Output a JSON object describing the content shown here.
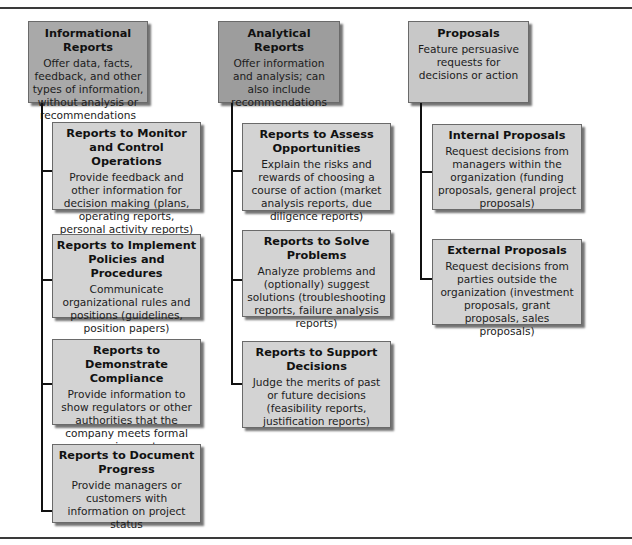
{
  "caption": "Figure: Common types of business reports and proposals",
  "colors": {
    "informational_parent": "#a9a9a9",
    "analytical_parent": "#9d9d9d",
    "proposals_parent": "#c8c8c8",
    "child_box": "#d3d3d3",
    "connector": "#111111",
    "rule": "#3a3a3a"
  },
  "columns": [
    {
      "title": "Informational Reports",
      "desc": "Offer data, facts, feedback, and other types of information, without analysis or recommendations",
      "children": [
        {
          "title": "Reports to Monitor and Control Operations",
          "desc": "Provide feedback and other information for decision making (plans, operating reports, personal activity reports)"
        },
        {
          "title": "Reports to Implement Policies and Procedures",
          "desc": "Communicate organizational rules and positions (guidelines, position papers)"
        },
        {
          "title": "Reports to Demonstrate Compliance",
          "desc": "Provide information to show regulators or other authorities that the company meets formal requirements"
        },
        {
          "title": "Reports to Document Progress",
          "desc": "Provide managers or customers with information on project status"
        }
      ]
    },
    {
      "title": "Analytical Reports",
      "desc": "Offer information and analysis; can also include recommendations",
      "children": [
        {
          "title": "Reports to Assess Opportunities",
          "desc": "Explain the risks and rewards of choosing a course of action (market analysis reports, due diligence reports)"
        },
        {
          "title": "Reports to Solve Problems",
          "desc": "Analyze problems and (optionally) suggest solutions (troubleshooting reports, failure analysis reports)"
        },
        {
          "title": "Reports to Support Decisions",
          "desc": "Judge the merits of past or future decisions (feasibility reports, justification reports)"
        }
      ]
    },
    {
      "title": "Proposals",
      "desc": "Feature persuasive requests for decisions or action",
      "children": [
        {
          "title": "Internal Proposals",
          "desc": "Request decisions from managers within the organization (funding proposals, general project proposals)"
        },
        {
          "title": "External Proposals",
          "desc": "Request decisions from parties outside the organization (investment proposals, grant proposals, sales proposals)"
        }
      ]
    }
  ]
}
